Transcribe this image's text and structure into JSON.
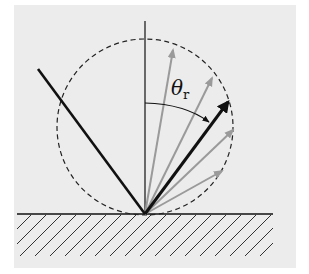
{
  "diagram": {
    "type": "specular-reflection-lobe",
    "colors": {
      "background": "#ececec",
      "panel": "#efefef",
      "line": "#111111",
      "gray_arrow": "#9a9a9a",
      "dashed_circle": "#222222"
    },
    "angle_label": {
      "symbol": "θ",
      "subscript": "r"
    },
    "elements": {
      "surface": "horizontal reflecting surface with hatching",
      "normal": "vertical surface normal",
      "incident_ray": "incoming light ray from upper-left",
      "reflected_ray": "bold black reflected ray (mirror direction)",
      "scattered_rays": "gray arrows spread around the mirror direction",
      "lobe": "dashed circle indicating reflectance distribution"
    }
  }
}
